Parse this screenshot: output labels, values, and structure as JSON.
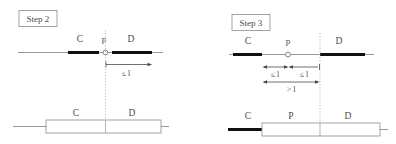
{
  "figure": {
    "type": "diagram",
    "background_color": "#ffffff",
    "stroke_color": "#6b6b6b",
    "bold_stroke_color": "#111111",
    "text_color": "#4a4a4a",
    "dotted_color": "#b9b9b9"
  },
  "panels": [
    {
      "id": "step2",
      "box_label": "Step 2",
      "top_track": {
        "axis_label_left": "C",
        "point_label": "p",
        "axis_label_right": "D",
        "point_marker": "open-circle"
      },
      "dimensions": [
        {
          "id": "s2-dim1",
          "label": "≤ l",
          "arrow": "right"
        }
      ],
      "bottom_track": {
        "left_label": "C",
        "right_label": "D"
      }
    },
    {
      "id": "step3",
      "box_label": "Step 3",
      "top_track": {
        "axis_label_left": "C",
        "point_label": "p",
        "axis_label_right": "D",
        "point_marker": "open-circle"
      },
      "dimensions": [
        {
          "id": "s3-dim1",
          "label": "≤ l",
          "arrow": "both"
        },
        {
          "id": "s3-dim2",
          "label": "≤ l",
          "arrow": "both"
        },
        {
          "id": "s3-dim3",
          "label": "> l",
          "arrow": "both"
        }
      ],
      "bottom_track": {
        "left_label": "C",
        "middle_label": "P",
        "right_label": "D"
      }
    }
  ]
}
